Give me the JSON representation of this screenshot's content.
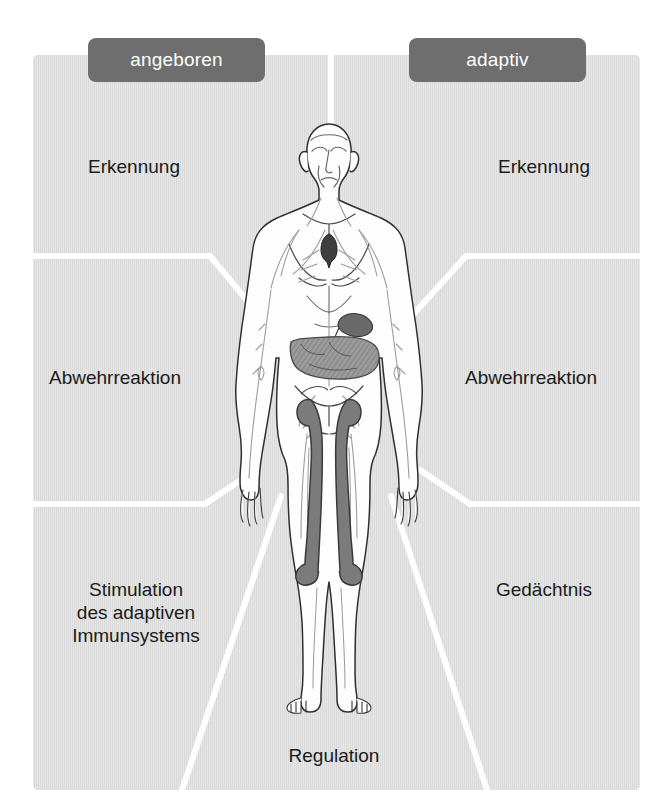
{
  "diagram": {
    "title_absent": true,
    "background_color": "#ffffff",
    "panel_color": "#dcdcdc",
    "chip_color": "#6e6e6e",
    "chip_text_color": "#ffffff",
    "label_text_color": "#1b1b1b",
    "divider_color": "#ffffff",
    "language": "de"
  },
  "columns": {
    "innate": {
      "chip_label": "angeboren"
    },
    "adaptive": {
      "chip_label": "adaptiv"
    }
  },
  "zones": {
    "innate_recognition": "Erkennung",
    "innate_defence": "Abwehrreaktion",
    "innate_stimulation": "Stimulation\ndes adaptiven\nImmunsystems",
    "adaptive_recognition": "Erkennung",
    "adaptive_defence": "Abwehrreaktion",
    "adaptive_memory": "Gedächtnis",
    "shared_regulation": "Regulation"
  },
  "illustration": {
    "name": "human-body-immune-system-figure",
    "description_absent": true,
    "organ_colors": {
      "skin_fill": "#fefefe",
      "outline": "#2b2b2b",
      "lymph_vessels": "#9a9a9a",
      "thymus_fill": "#4a4a4a",
      "spleen_fill": "#6d6d6d",
      "intestine_fill": "#8e8e8e",
      "bone_fill": "#7c7c7c"
    }
  }
}
